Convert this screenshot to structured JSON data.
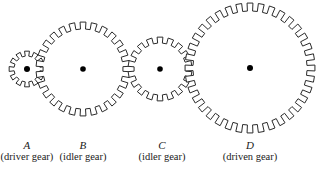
{
  "figure": {
    "kind": "gear-train-diagram",
    "width": 322,
    "height": 175,
    "background_color": "#ffffff",
    "stroke_color": "#2b2b2b",
    "hub_color": "#000000",
    "text_color": "#1a1a1a"
  },
  "gears": [
    {
      "id": "A",
      "letter": "A",
      "role": "(driver gear)",
      "teeth": 12,
      "cx": 27,
      "cy": 69,
      "outer_radius": 18,
      "root_radius": 13,
      "hub_radius": 3,
      "label_center_x": 27,
      "label_top_y": 139
    },
    {
      "id": "B",
      "letter": "B",
      "role": "(idler gear)",
      "teeth": 26,
      "cx": 83,
      "cy": 69,
      "outer_radius": 47,
      "root_radius": 40,
      "hub_radius": 2.8,
      "label_center_x": 83,
      "label_top_y": 139
    },
    {
      "id": "C",
      "letter": "C",
      "role": "(idler gear)",
      "teeth": 18,
      "cx": 160,
      "cy": 69,
      "outer_radius": 32,
      "root_radius": 26,
      "hub_radius": 2.8,
      "label_center_x": 162,
      "label_top_y": 139
    },
    {
      "id": "D",
      "letter": "D",
      "role": "(driven gear)",
      "teeth": 36,
      "cx": 250,
      "cy": 68,
      "outer_radius": 65,
      "root_radius": 57,
      "hub_radius": 3,
      "label_center_x": 250,
      "label_top_y": 139
    }
  ]
}
